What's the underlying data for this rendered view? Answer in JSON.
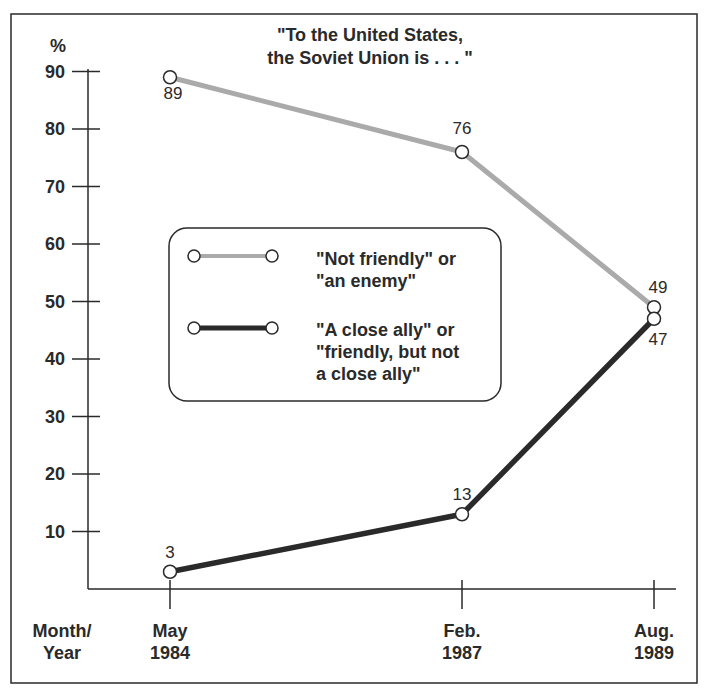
{
  "chart_data": {
    "type": "line",
    "title": "\"To the United States, the Soviet Union is . . . \"",
    "title_lines": [
      "\"To the United States,",
      "the Soviet Union is . . . \""
    ],
    "xlabel": "Month/Year",
    "xlabel_lines": [
      "Month/",
      "Year"
    ],
    "ylabel": "%",
    "ylim": [
      0,
      90
    ],
    "yticks": [
      10,
      20,
      30,
      40,
      50,
      60,
      70,
      80,
      90
    ],
    "categories": [
      "May 1984",
      "Feb. 1987",
      "Aug. 1989"
    ],
    "category_lines": [
      [
        "May",
        "1984"
      ],
      [
        "Feb.",
        "1987"
      ],
      [
        "Aug.",
        "1989"
      ]
    ],
    "series": [
      {
        "name": "\"Not friendly\" or \"an enemy\"",
        "legend_lines": [
          "\"Not friendly\" or",
          "\"an enemy\""
        ],
        "values": [
          89,
          76,
          49
        ],
        "color": "#aaaaaa"
      },
      {
        "name": "\"A close ally\" or \"friendly, but not a close ally\"",
        "legend_lines": [
          "\"A close ally\" or",
          "\"friendly, but not",
          "a close ally\""
        ],
        "values": [
          3,
          13,
          47
        ],
        "color": "#2a2a2a"
      }
    ],
    "grid": false,
    "legend_position": "center-left"
  }
}
